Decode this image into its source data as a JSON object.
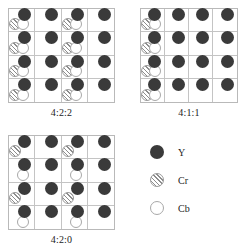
{
  "figure": {
    "grid_rows": 4,
    "grid_cols": 4
  },
  "colors": {
    "luma": "#3a3a3a",
    "chroma_red_fill": "#f2f2f2",
    "chroma_red_hatch": "#8d8d8d",
    "chroma_blue_fill": "#ffffff",
    "cell_border": "#c4c4c4",
    "grid_border": "#b9b9b9",
    "text": "#1c1c1c"
  },
  "panels": [
    {
      "id": "panel-422",
      "caption": "4:2:2",
      "description": "Luma sampled at every position; chroma pair sampled in columns 1 and 3 of every row",
      "cells": [
        [
          {
            "y": true,
            "cr": true,
            "cb": true
          },
          {
            "y": true,
            "cr": false,
            "cb": false
          },
          {
            "y": true,
            "cr": true,
            "cb": true
          },
          {
            "y": true,
            "cr": false,
            "cb": false
          }
        ],
        [
          {
            "y": true,
            "cr": true,
            "cb": true
          },
          {
            "y": true,
            "cr": false,
            "cb": false
          },
          {
            "y": true,
            "cr": true,
            "cb": true
          },
          {
            "y": true,
            "cr": false,
            "cb": false
          }
        ],
        [
          {
            "y": true,
            "cr": true,
            "cb": true
          },
          {
            "y": true,
            "cr": false,
            "cb": false
          },
          {
            "y": true,
            "cr": true,
            "cb": true
          },
          {
            "y": true,
            "cr": false,
            "cb": false
          }
        ],
        [
          {
            "y": true,
            "cr": true,
            "cb": true
          },
          {
            "y": true,
            "cr": false,
            "cb": false
          },
          {
            "y": true,
            "cr": true,
            "cb": true
          },
          {
            "y": true,
            "cr": false,
            "cb": false
          }
        ]
      ]
    },
    {
      "id": "panel-411",
      "caption": "4:1:1",
      "description": "Luma sampled at every position; chroma pair sampled only in column 1 of every row",
      "cells": [
        [
          {
            "y": true,
            "cr": true,
            "cb": true
          },
          {
            "y": true,
            "cr": false,
            "cb": false
          },
          {
            "y": true,
            "cr": false,
            "cb": false
          },
          {
            "y": true,
            "cr": false,
            "cb": false
          }
        ],
        [
          {
            "y": true,
            "cr": true,
            "cb": true
          },
          {
            "y": true,
            "cr": false,
            "cb": false
          },
          {
            "y": true,
            "cr": false,
            "cb": false
          },
          {
            "y": true,
            "cr": false,
            "cb": false
          }
        ],
        [
          {
            "y": true,
            "cr": true,
            "cb": true
          },
          {
            "y": true,
            "cr": false,
            "cb": false
          },
          {
            "y": true,
            "cr": false,
            "cb": false
          },
          {
            "y": true,
            "cr": false,
            "cb": false
          }
        ],
        [
          {
            "y": true,
            "cr": true,
            "cb": true
          },
          {
            "y": true,
            "cr": false,
            "cb": false
          },
          {
            "y": true,
            "cr": false,
            "cb": false
          },
          {
            "y": true,
            "cr": false,
            "cb": false
          }
        ]
      ]
    },
    {
      "id": "panel-420",
      "caption": "4:2:0",
      "description": "Luma sampled at every position; columns 1 and 3 carry chroma, alternating Cr on rows 1 and 3, Cb on rows 2 and 4",
      "cells": [
        [
          {
            "y": true,
            "cr": true,
            "cb": false
          },
          {
            "y": true,
            "cr": false,
            "cb": false
          },
          {
            "y": true,
            "cr": true,
            "cb": false
          },
          {
            "y": true,
            "cr": false,
            "cb": false
          }
        ],
        [
          {
            "y": true,
            "cr": false,
            "cb": true
          },
          {
            "y": true,
            "cr": false,
            "cb": false
          },
          {
            "y": true,
            "cr": false,
            "cb": true
          },
          {
            "y": true,
            "cr": false,
            "cb": false
          }
        ],
        [
          {
            "y": true,
            "cr": true,
            "cb": false
          },
          {
            "y": true,
            "cr": false,
            "cb": false
          },
          {
            "y": true,
            "cr": true,
            "cb": false
          },
          {
            "y": true,
            "cr": false,
            "cb": false
          }
        ],
        [
          {
            "y": true,
            "cr": false,
            "cb": true
          },
          {
            "y": true,
            "cr": false,
            "cb": false
          },
          {
            "y": true,
            "cr": false,
            "cb": true
          },
          {
            "y": true,
            "cr": false,
            "cb": false
          }
        ]
      ]
    }
  ],
  "legend": {
    "items": [
      {
        "symbol": "luma-sample-icon",
        "label": "Y"
      },
      {
        "symbol": "chroma-red-sample-icon",
        "label": "Cr"
      },
      {
        "symbol": "chroma-blue-sample-icon",
        "label": "Cb"
      }
    ]
  }
}
